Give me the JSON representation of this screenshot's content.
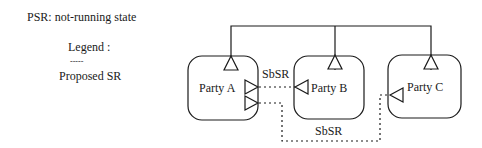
{
  "notes": {
    "state_label": "PSR: not-running state",
    "legend_title": "Legend :",
    "legend_dots": "- - - - -",
    "legend_item": "Proposed SR"
  },
  "diagram": {
    "parties": [
      {
        "id": "A",
        "label": "Party A"
      },
      {
        "id": "B",
        "label": "Party B"
      },
      {
        "id": "C",
        "label": "Party C"
      }
    ],
    "links": [
      {
        "label": "SbSR",
        "from": "Party A",
        "to": "Party B",
        "style": "dotted"
      },
      {
        "label": "SbSR",
        "from": "Party A",
        "to": "Party C",
        "style": "dotted"
      }
    ],
    "bus": {
      "style": "solid",
      "connects": [
        "Party A",
        "Party B",
        "Party C"
      ]
    },
    "colors": {
      "stroke": "#1a1a1a",
      "background": "#ffffff"
    }
  }
}
